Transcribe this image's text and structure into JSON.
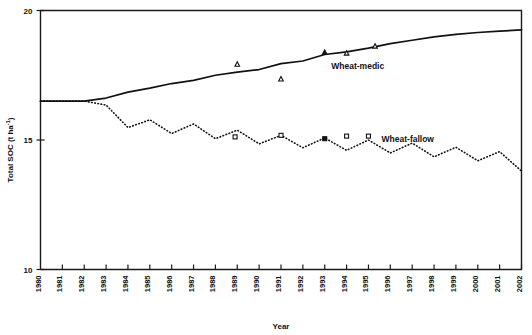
{
  "chart_data": {
    "type": "line",
    "title": "",
    "xlabel": "Year",
    "ylabel": "Total SOC (t ha-1)",
    "ylabel_display": "Total SOC (t ha",
    "ylabel_sup": "-1",
    "ylabel_tail": ")",
    "xlim": [
      1980,
      2002
    ],
    "ylim": [
      10,
      20
    ],
    "ytick_values": [
      10,
      15,
      20
    ],
    "ytick_labels": [
      "10",
      "15",
      "20"
    ],
    "grid": false,
    "legend": "inline-labels",
    "xtick_labels": [
      "1980",
      "1981",
      "1982",
      "1983",
      "1984",
      "1985",
      "1986",
      "1987",
      "1988",
      "1989",
      "1990",
      "1991",
      "1992",
      "1993",
      "1994",
      "1995",
      "1996",
      "1997",
      "1998",
      "1999",
      "2000",
      "2001",
      "2002"
    ],
    "x": [
      1980,
      1981,
      1982,
      1983,
      1984,
      1985,
      1986,
      1987,
      1988,
      1989,
      1990,
      1991,
      1992,
      1993,
      1994,
      1995,
      1996,
      1997,
      1998,
      1999,
      2000,
      2001,
      2002
    ],
    "series": [
      {
        "name": "Wheat-medic",
        "style": "solid",
        "label": "Wheat-medic",
        "label_x": 1993.3,
        "label_y": 17.85,
        "values": [
          16.5,
          16.5,
          16.5,
          16.62,
          16.85,
          17.0,
          17.18,
          17.3,
          17.5,
          17.62,
          17.72,
          17.95,
          18.05,
          18.3,
          18.4,
          18.55,
          18.72,
          18.85,
          18.98,
          19.08,
          19.15,
          19.2,
          19.25
        ]
      },
      {
        "name": "Wheat-fallow",
        "style": "dotted",
        "label": "Wheat-fallow",
        "label_x": 1995.6,
        "label_y": 15.03,
        "values": [
          16.5,
          16.5,
          16.5,
          16.35,
          15.48,
          15.78,
          15.25,
          15.62,
          15.05,
          15.38,
          14.85,
          15.18,
          14.7,
          15.08,
          14.6,
          15.0,
          14.5,
          14.88,
          14.35,
          14.72,
          14.2,
          14.55,
          13.8
        ]
      }
    ],
    "markers": [
      {
        "series": "Wheat-medic",
        "shape": "triangle",
        "fill": "open",
        "x": 1989.0,
        "y": 17.92
      },
      {
        "series": "Wheat-medic",
        "shape": "triangle",
        "fill": "open",
        "x": 1991.0,
        "y": 17.35
      },
      {
        "series": "Wheat-medic",
        "shape": "triangle",
        "fill": "filled",
        "x": 1993.0,
        "y": 18.38
      },
      {
        "series": "Wheat-medic",
        "shape": "triangle",
        "fill": "open",
        "x": 1994.0,
        "y": 18.35
      },
      {
        "series": "Wheat-medic",
        "shape": "triangle",
        "fill": "open",
        "x": 1995.3,
        "y": 18.62
      },
      {
        "series": "Wheat-fallow",
        "shape": "square",
        "fill": "open",
        "x": 1988.9,
        "y": 15.12
      },
      {
        "series": "Wheat-fallow",
        "shape": "square",
        "fill": "open",
        "x": 1991.0,
        "y": 15.18
      },
      {
        "series": "Wheat-fallow",
        "shape": "square",
        "fill": "filled",
        "x": 1993.0,
        "y": 15.05
      },
      {
        "series": "Wheat-fallow",
        "shape": "square",
        "fill": "open",
        "x": 1994.0,
        "y": 15.15
      },
      {
        "series": "Wheat-fallow",
        "shape": "square",
        "fill": "open",
        "x": 1995.0,
        "y": 15.15
      }
    ],
    "colors": {
      "line": "#111111",
      "axis": "#1a1a1a",
      "background": "#ffffff"
    }
  }
}
